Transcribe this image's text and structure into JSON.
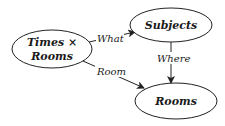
{
  "diagram": {
    "nodes": [
      {
        "id": "times_rooms",
        "label_line1": "Times ×",
        "label_line2": "Rooms",
        "cx": 52,
        "cy": 49,
        "rx": 40,
        "ry": 19
      },
      {
        "id": "subjects",
        "label": "Subjects",
        "cx": 171,
        "cy": 25,
        "rx": 41,
        "ry": 17
      },
      {
        "id": "rooms",
        "label": "Rooms",
        "cx": 176,
        "cy": 101,
        "rx": 41,
        "ry": 18
      }
    ],
    "edges": [
      {
        "id": "what",
        "from": "times_rooms",
        "to": "subjects",
        "label": "What"
      },
      {
        "id": "room",
        "from": "times_rooms",
        "to": "rooms",
        "label": "Room"
      },
      {
        "id": "where",
        "from": "subjects",
        "to": "rooms",
        "label": "Where"
      }
    ],
    "colors": {
      "stroke": "#222222",
      "text": "#1a1a1a",
      "background": "#ffffff"
    }
  }
}
